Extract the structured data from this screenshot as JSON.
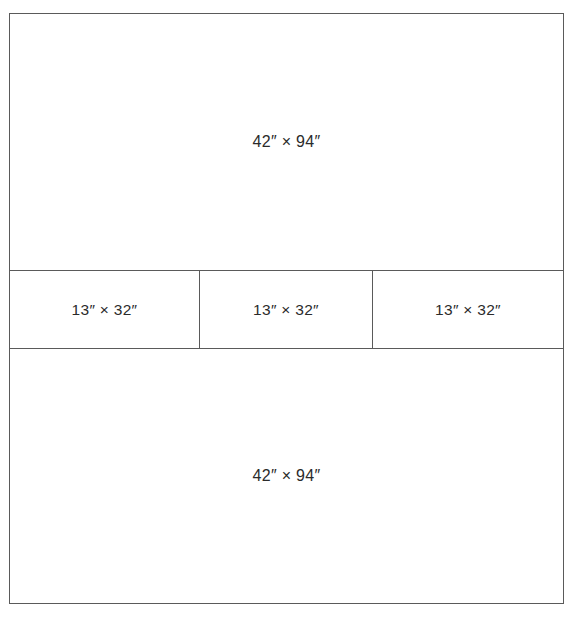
{
  "diagram": {
    "units": "inches",
    "stroke_color": "#5a5a5a",
    "background_color": "#ffffff",
    "text_color": "#2b2b2b",
    "panels": [
      {
        "id": "top-panel",
        "label": "42″ × 94″",
        "width_in": 42,
        "height_in": 94,
        "row": "top"
      },
      {
        "id": "middle-panel-left",
        "label": "13″ × 32″",
        "width_in": 13,
        "height_in": 32,
        "row": "middle"
      },
      {
        "id": "middle-panel-center",
        "label": "13″ × 32″",
        "width_in": 13,
        "height_in": 32,
        "row": "middle"
      },
      {
        "id": "middle-panel-right",
        "label": "13″ × 32″",
        "width_in": 13,
        "height_in": 32,
        "row": "middle"
      },
      {
        "id": "bottom-panel",
        "label": "42″ × 94″",
        "width_in": 42,
        "height_in": 94,
        "row": "bottom"
      }
    ]
  }
}
